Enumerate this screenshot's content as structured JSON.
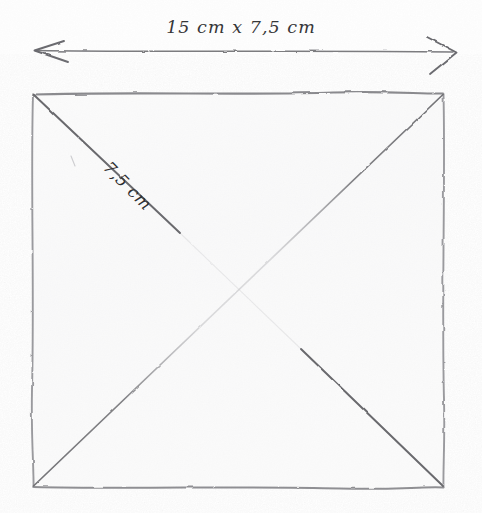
{
  "figure": {
    "kind": "hand-drawn-pencil-sketch",
    "background_color": "#fefefe",
    "pencil_color": "#6f6f72",
    "ink_color": "#36363a",
    "fill_color": "#f7f7f7"
  },
  "dimension_arrow": {
    "name": "width-dimension-arrow",
    "label": "15 cm x 7,5 cm",
    "left_arrow_x": 35,
    "right_arrow_x": 455,
    "line_y": 51,
    "has_left_arrowhead": true,
    "has_right_arrowhead": true
  },
  "square": {
    "name": "fabric-square",
    "left": 32,
    "top": 93,
    "right": 444,
    "bottom": 487,
    "width_px": 412,
    "height_px": 394,
    "stroke": "#8a8a8e",
    "fill": "#f6f6f6"
  },
  "diagonals": [
    {
      "name": "diagonal-top-left-to-bottom-right",
      "from": "top-left",
      "to": "bottom-right",
      "style": "two dark pencil segments with faint gap at centre",
      "label": "7,5 cm",
      "segments": [
        {
          "x1": 33,
          "y1": 94,
          "x2": 180,
          "y2": 233
        },
        {
          "x1": 301,
          "y1": 349,
          "x2": 443,
          "y2": 486
        }
      ]
    },
    {
      "name": "diagonal-bottom-left-to-top-right",
      "from": "bottom-left",
      "to": "top-right",
      "style": "continuous pencil line, faint through centre",
      "label": "",
      "segments": [
        {
          "x1": 33,
          "y1": 486,
          "x2": 443,
          "y2": 94
        }
      ]
    }
  ],
  "labels": {
    "width": "15 cm x 7,5 cm",
    "diagonal": "7,5 cm"
  },
  "measurements": {
    "overall": "15 cm x 7,5 cm",
    "fold_diagonal": "7,5 cm",
    "unit": "cm",
    "decimal_separator": ","
  }
}
